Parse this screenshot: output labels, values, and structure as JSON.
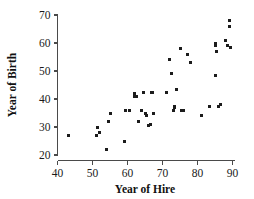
{
  "chart_data": {
    "type": "scatter",
    "title": "",
    "xlabel": "Year of Hire",
    "ylabel": "Year of Birth",
    "xlim": [
      38,
      91.5
    ],
    "ylim": [
      18.5,
      71.5
    ],
    "xticks": [
      40,
      50,
      60,
      70,
      80,
      90
    ],
    "yticks": [
      20,
      30,
      40,
      50,
      60,
      70
    ],
    "xtick_labels": [
      "40",
      "50",
      "60",
      "70",
      "80",
      "90"
    ],
    "ytick_labels": [
      "20",
      "30",
      "40",
      "50",
      "60",
      "70"
    ],
    "grid": false,
    "legend": false,
    "marker": "square",
    "marker_color": "#1c1c1c",
    "marker_size_px": 3,
    "axis_color": "#4a4a4a",
    "background": "#ffffff",
    "series": [
      {
        "name": "employees",
        "points": [
          [
            43,
            27
          ],
          [
            51,
            27
          ],
          [
            51.5,
            30
          ],
          [
            52,
            28
          ],
          [
            54,
            22
          ],
          [
            54.5,
            32
          ],
          [
            55,
            35
          ],
          [
            59,
            25
          ],
          [
            59.5,
            36
          ],
          [
            60.5,
            36
          ],
          [
            62,
            41
          ],
          [
            62,
            42
          ],
          [
            62.5,
            41
          ],
          [
            63,
            32
          ],
          [
            64,
            36
          ],
          [
            64.5,
            42.5
          ],
          [
            65,
            35
          ],
          [
            65.5,
            34
          ],
          [
            66,
            30.5
          ],
          [
            66.5,
            31
          ],
          [
            66.8,
            42.5
          ],
          [
            67,
            42.5
          ],
          [
            67.5,
            35
          ],
          [
            71,
            42.5
          ],
          [
            72,
            54
          ],
          [
            72.5,
            49
          ],
          [
            73,
            36
          ],
          [
            73.5,
            37
          ],
          [
            73.5,
            37.5
          ],
          [
            74,
            43.5
          ],
          [
            75,
            58
          ],
          [
            75.5,
            36
          ],
          [
            76,
            36
          ],
          [
            77,
            56
          ],
          [
            78,
            53
          ],
          [
            81,
            34
          ],
          [
            83.5,
            37.5
          ],
          [
            85,
            48.5
          ],
          [
            85,
            59
          ],
          [
            85.2,
            60
          ],
          [
            85.5,
            57
          ],
          [
            86,
            37.5
          ],
          [
            86.5,
            38
          ],
          [
            88,
            61
          ],
          [
            88.5,
            59
          ],
          [
            89,
            68
          ],
          [
            89,
            66
          ],
          [
            89.5,
            58.5
          ]
        ]
      }
    ]
  },
  "axis": {
    "x_title": "Year of Hire",
    "y_title": "Year of Birth"
  }
}
